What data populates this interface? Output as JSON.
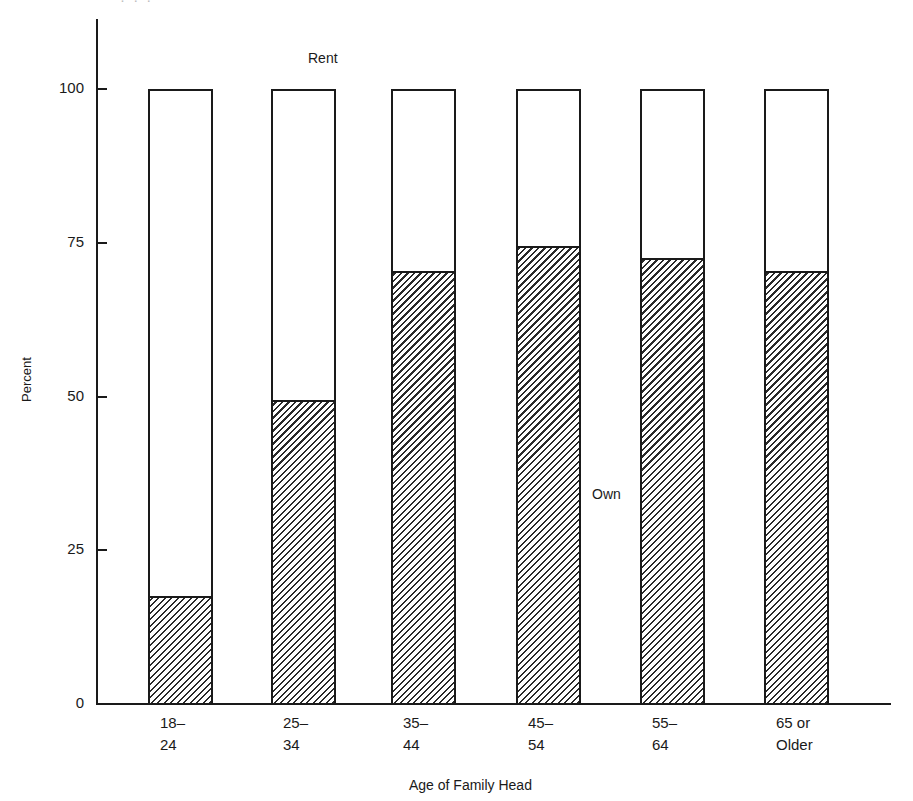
{
  "chart_data": {
    "type": "bar",
    "stacked": true,
    "title": "",
    "xlabel": "Age of Family Head",
    "ylabel": "Percent",
    "ylim": [
      0,
      100
    ],
    "yticks": [
      0,
      25,
      50,
      75,
      100
    ],
    "grid": false,
    "categories": [
      "18-24",
      "25-34",
      "35-44",
      "45-54",
      "55-64",
      "65 or Older"
    ],
    "category_labels": [
      "18–\n24",
      "25–\n34",
      "35–\n44",
      "45–\n54",
      "55–\n64",
      "65 or\nOlder"
    ],
    "series": [
      {
        "name": "Own",
        "values": [
          17,
          49,
          70,
          74,
          72,
          70
        ],
        "fill": "hatched"
      },
      {
        "name": "Rent",
        "values": [
          83,
          51,
          30,
          26,
          28,
          30
        ],
        "fill": "white"
      }
    ],
    "annotations": [
      {
        "text": "Rent",
        "position": "above second bar"
      },
      {
        "text": "Own",
        "position": "between 45-54 and 55-64 bars, mid-height"
      }
    ]
  },
  "labels": {
    "y_title": "Percent",
    "x_title": "Age of Family Head",
    "rent": "Rent",
    "own": "Own",
    "yticks": [
      "0",
      "25",
      "50",
      "75",
      "100"
    ],
    "cutoff_text": "· · ·"
  },
  "style": {
    "ink": "#1a1a1a",
    "background": "#ffffff"
  }
}
